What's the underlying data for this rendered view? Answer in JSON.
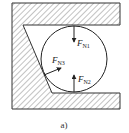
{
  "figure": {
    "caption": "a)",
    "colors": {
      "line": "#333333",
      "hatch": "#555555",
      "background": "#ffffff"
    },
    "forces": [
      {
        "id": "FN1",
        "symbol": "F",
        "subscript": "N1",
        "direction": "down"
      },
      {
        "id": "FN2",
        "symbol": "F",
        "subscript": "N2",
        "direction": "up"
      },
      {
        "id": "FN3",
        "symbol": "F",
        "subscript": "N3",
        "direction": "up-right (normal to inclined wall)"
      }
    ]
  }
}
